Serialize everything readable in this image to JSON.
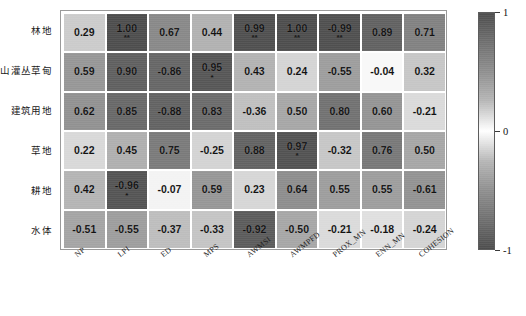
{
  "chart_data": {
    "type": "heatmap",
    "title": "",
    "xlabel": "",
    "ylabel": "",
    "grid": false,
    "legend_position": "right",
    "colormap": "grayscale-diverging",
    "colorbar": {
      "min": -1,
      "max": 1,
      "ticks": [
        1,
        0,
        -1
      ],
      "tick_labels": [
        "1",
        "0",
        "-1"
      ]
    },
    "x_categories": [
      "NP",
      "LPI",
      "ED",
      "MPS",
      "AWMSI",
      "AWMPFD",
      "PROX_MN",
      "ENN_MN",
      "COHESION"
    ],
    "y_categories": [
      "林地",
      "高山灌丛草甸",
      "建筑用地",
      "草地",
      "耕地",
      "水体"
    ],
    "values": [
      [
        0.29,
        1.0,
        0.67,
        0.44,
        0.99,
        1.0,
        -0.99,
        0.89,
        0.71
      ],
      [
        0.59,
        0.9,
        -0.86,
        0.95,
        0.43,
        0.24,
        -0.55,
        -0.04,
        0.32
      ],
      [
        0.62,
        0.85,
        -0.88,
        0.83,
        -0.36,
        0.5,
        0.8,
        0.6,
        -0.21
      ],
      [
        0.22,
        0.45,
        0.75,
        -0.25,
        0.88,
        0.97,
        -0.32,
        0.76,
        0.5
      ],
      [
        0.42,
        -0.96,
        -0.07,
        0.59,
        0.23,
        0.64,
        0.55,
        0.55,
        -0.61
      ],
      [
        -0.51,
        -0.55,
        -0.37,
        -0.33,
        -0.92,
        -0.5,
        -0.21,
        -0.18,
        -0.24
      ]
    ],
    "value_labels": [
      [
        "0.29",
        "1.00",
        "0.67",
        "0.44",
        "0.99",
        "1.00",
        "-0.99",
        "0.89",
        "0.71"
      ],
      [
        "0.59",
        "0.90",
        "-0.86",
        "0.95",
        "0.43",
        "0.24",
        "-0.55",
        "-0.04",
        "0.32"
      ],
      [
        "0.62",
        "0.85",
        "-0.88",
        "0.83",
        "-0.36",
        "0.50",
        "0.80",
        "0.60",
        "-0.21"
      ],
      [
        "0.22",
        "0.45",
        "0.75",
        "-0.25",
        "0.88",
        "0.97",
        "-0.32",
        "0.76",
        "0.50"
      ],
      [
        "0.42",
        "-0.96",
        "-0.07",
        "0.59",
        "0.23",
        "0.64",
        "0.55",
        "0.55",
        "-0.61"
      ],
      [
        "-0.51",
        "-0.55",
        "-0.37",
        "-0.33",
        "-0.92",
        "-0.50",
        "-0.21",
        "-0.18",
        "-0.24"
      ]
    ],
    "significance": [
      [
        "",
        "**",
        "",
        "",
        "**",
        "**",
        "**",
        "",
        ""
      ],
      [
        "",
        "",
        "",
        "*",
        "",
        "",
        "",
        "",
        ""
      ],
      [
        "",
        "",
        "",
        "",
        "",
        "",
        "",
        "",
        ""
      ],
      [
        "",
        "",
        "",
        "",
        "",
        "*",
        "",
        "",
        ""
      ],
      [
        "",
        "*",
        "",
        "",
        "",
        "",
        "",
        "",
        ""
      ],
      [
        "",
        "",
        "",
        "",
        "",
        "",
        "",
        "",
        ""
      ]
    ]
  },
  "caption": {
    "text": ""
  }
}
